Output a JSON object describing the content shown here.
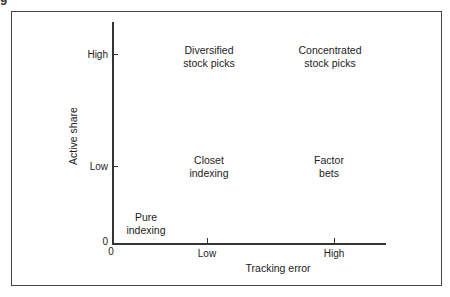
{
  "caption_fragment": "g",
  "diagram": {
    "type": "2x2 matrix",
    "y_axis": {
      "title": "Active share",
      "ticks": [
        "0",
        "Low",
        "High"
      ]
    },
    "x_axis": {
      "title": "Tracking error",
      "ticks": [
        "0",
        "Low",
        "High"
      ]
    },
    "quadrants": [
      {
        "id": "diversified",
        "label": "Diversified\nstock picks",
        "x": "Low",
        "y": "High"
      },
      {
        "id": "concentrated",
        "label": "Concentrated\nstock picks",
        "x": "High",
        "y": "High"
      },
      {
        "id": "closet",
        "label": "Closet\nindexing",
        "x": "Low",
        "y": "Low"
      },
      {
        "id": "factor",
        "label": "Factor\nbets",
        "x": "High",
        "y": "Low"
      },
      {
        "id": "pure",
        "label": "Pure\nindexing",
        "x": "0",
        "y": "0"
      }
    ]
  }
}
